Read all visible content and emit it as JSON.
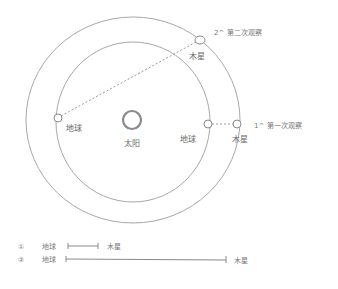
{
  "diagram": {
    "type": "orbital-observation-sketch",
    "colors": {
      "stroke": "#9a9a9a",
      "sun": "#888888",
      "text": "#6a6a6a"
    },
    "sun": {
      "label": "太阳"
    },
    "earth_pos_1": {
      "label": "地球"
    },
    "earth_pos_2": {
      "label": "地球"
    },
    "jupiter_pos_1": {
      "label": "木星"
    },
    "jupiter_pos_2": {
      "label": "木星"
    },
    "observation_1": {
      "label": "1^ 第一次观察"
    },
    "observation_2": {
      "label": "2^ 第二次观察"
    },
    "legend": [
      {
        "marker": "①",
        "from": "地球",
        "to": "木星"
      },
      {
        "marker": "②",
        "from": "地球",
        "to": "木星"
      }
    ]
  }
}
